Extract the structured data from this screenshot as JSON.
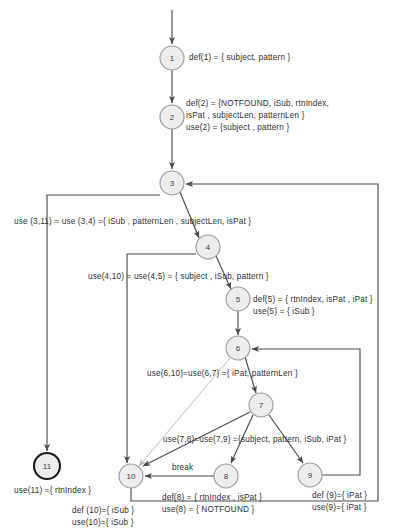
{
  "diagram": {
    "type": "control-flow-graph",
    "colors": {
      "edge": "#4a4a4a",
      "edge_faint": "#c9c9c9",
      "node_fill": "#ededed",
      "node_stroke": "#9a9a9a",
      "terminal_stroke": "#1c1c1c",
      "text": "#2e2e2e",
      "background": "#ffffff"
    },
    "nodes": [
      {
        "id": "1",
        "label": "1",
        "cx": 172,
        "cy": 58,
        "r": 12,
        "terminal": false
      },
      {
        "id": "2",
        "label": "2",
        "cx": 172,
        "cy": 117,
        "r": 12,
        "terminal": false
      },
      {
        "id": "3",
        "label": "3",
        "cx": 172,
        "cy": 183,
        "r": 12,
        "terminal": false
      },
      {
        "id": "4",
        "label": "4",
        "cx": 208,
        "cy": 247,
        "r": 12,
        "terminal": false
      },
      {
        "id": "5",
        "label": "5",
        "cx": 238,
        "cy": 299,
        "r": 12,
        "terminal": false
      },
      {
        "id": "6",
        "label": "6",
        "cx": 238,
        "cy": 348,
        "r": 12,
        "terminal": false
      },
      {
        "id": "7",
        "label": "7",
        "cx": 261,
        "cy": 405,
        "r": 12,
        "terminal": false
      },
      {
        "id": "8",
        "label": "8",
        "cx": 226,
        "cy": 476,
        "r": 12,
        "terminal": false
      },
      {
        "id": "9",
        "label": "9",
        "cx": 310,
        "cy": 475,
        "r": 12,
        "terminal": false
      },
      {
        "id": "10",
        "label": "10",
        "cx": 131,
        "cy": 476,
        "r": 12,
        "terminal": false
      },
      {
        "id": "11",
        "label": "11",
        "cx": 47,
        "cy": 466,
        "r": 13,
        "terminal": true
      }
    ],
    "edges": [
      {
        "from": "entry",
        "to": "1",
        "kind": "straight"
      },
      {
        "from": "1",
        "to": "2",
        "kind": "straight"
      },
      {
        "from": "2",
        "to": "3",
        "kind": "straight"
      },
      {
        "from": "3",
        "to": "4",
        "kind": "diagonal"
      },
      {
        "from": "3",
        "to": "11",
        "kind": "orthogonal-left"
      },
      {
        "from": "4",
        "to": "5",
        "kind": "diagonal"
      },
      {
        "from": "4",
        "to": "10",
        "kind": "orthogonal-left"
      },
      {
        "from": "5",
        "to": "6",
        "kind": "straight"
      },
      {
        "from": "6",
        "to": "7",
        "kind": "diagonal"
      },
      {
        "from": "6",
        "to": "10",
        "kind": "diagonal-faint"
      },
      {
        "from": "7",
        "to": "8",
        "kind": "diagonal"
      },
      {
        "from": "7",
        "to": "9",
        "kind": "diagonal"
      },
      {
        "from": "7",
        "to": "10",
        "kind": "diagonal"
      },
      {
        "from": "8",
        "to": "10",
        "kind": "horizontal",
        "label": "break"
      },
      {
        "from": "9",
        "to": "6",
        "kind": "orthogonal-right-inner"
      },
      {
        "from": "10",
        "to": "3",
        "kind": "orthogonal-right-outer"
      }
    ],
    "annotations": [
      {
        "name": "def-1",
        "text": "def(1) = { subject, pattern }",
        "x": 189,
        "y": 52
      },
      {
        "name": "def-2",
        "text": "def(2) = {NOTFOUND, iSub, rtnIndex,",
        "x": 186,
        "y": 98
      },
      {
        "name": "def-2-cont",
        "text": "isPat , subjectLen, patternLen }",
        "x": 186,
        "y": 110
      },
      {
        "name": "use-2",
        "text": "use(2) = {subject , pattern }",
        "x": 186,
        "y": 122
      },
      {
        "name": "use-3-11",
        "text": "use (3,11) = use (3,4) ={ iSub , patternLen ,  subjectLen,  isPat }",
        "x": 14,
        "y": 216
      },
      {
        "name": "use-4-10",
        "text": "use(4,10) = use(4,5) = { subject , iSub, pattern }",
        "x": 88,
        "y": 271
      },
      {
        "name": "def-5",
        "text": "def(5) = { rtnIndex, isPat , iPat }",
        "x": 253,
        "y": 294
      },
      {
        "name": "use-5",
        "text": "use(5)  = { iSub }",
        "x": 253,
        "y": 306
      },
      {
        "name": "use-6-10",
        "text": "use(6,10)=use(6,7) ={ iPat, patternLen }",
        "x": 147,
        "y": 368
      },
      {
        "name": "use-7-8",
        "text": "use(7,8)=use(7,9) ={subject, pattern, iSub, iPat }",
        "x": 163,
        "y": 434
      },
      {
        "name": "break-label",
        "text": "break",
        "x": 172,
        "y": 462
      },
      {
        "name": "def-8",
        "text": "def(8) = { rtnIndex , isPat }",
        "x": 162,
        "y": 492
      },
      {
        "name": "use-8",
        "text": "use(8) = { NOTFOUND }",
        "x": 162,
        "y": 504
      },
      {
        "name": "def-9",
        "text": "def (9)={ iPat }",
        "x": 312,
        "y": 490
      },
      {
        "name": "use-9",
        "text": "use(9)={ iPat }",
        "x": 312,
        "y": 502
      },
      {
        "name": "def-10",
        "text": "def (10)={ iSub }",
        "x": 72,
        "y": 505
      },
      {
        "name": "use-10",
        "text": "use(10)={ iSub }",
        "x": 72,
        "y": 517
      },
      {
        "name": "use-11",
        "text": "use(11) ={ rtnIndex }",
        "x": 14,
        "y": 485
      }
    ]
  }
}
